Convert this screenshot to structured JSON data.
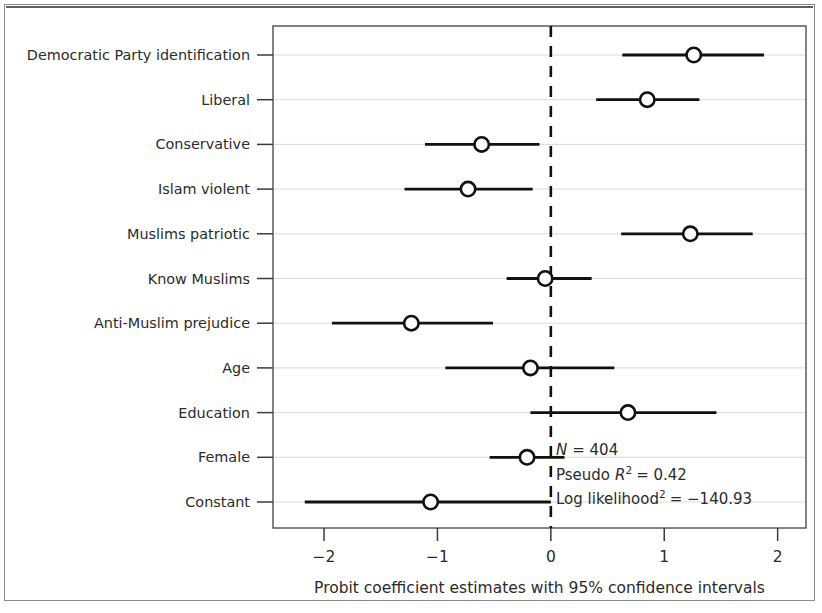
{
  "figure": {
    "background_color": "#ffffff",
    "line_color": "#111111",
    "grid_color": "#d9d9d9",
    "frame_color": "#4f4f4f"
  },
  "annotations": {
    "n_label": "N",
    "n_value": "= 404",
    "pseudo_label": "Pseudo",
    "pseudo_r": "R",
    "pseudo_sup": "2",
    "pseudo_value": "= 0.42",
    "loglik_label": "Log likelihood",
    "loglik_sup": "2",
    "loglik_value": "= −140.93"
  },
  "chart_data": {
    "type": "scatter",
    "title": "",
    "xlabel": "Probit coefficient estimates with 95% confidence intervals",
    "ylabel": "",
    "xlim": [
      -2.45,
      2.25
    ],
    "xticks": [
      -2,
      -1,
      0,
      1,
      2
    ],
    "xticklabels": [
      "−2",
      "−1",
      "0",
      "1",
      "2"
    ],
    "grid": true,
    "legend": "none",
    "reference_line": 0,
    "reference_line_style": "dashed",
    "categories": [
      "Democratic Party identification",
      "Liberal",
      "Conservative",
      "Islam violent",
      "Muslims patriotic",
      "Know Muslims",
      "Anti-Muslim prejudice",
      "Age",
      "Education",
      "Female",
      "Constant"
    ],
    "estimates": [
      1.26,
      0.85,
      -0.61,
      -0.73,
      1.23,
      -0.05,
      -1.23,
      -0.18,
      0.68,
      -0.21,
      -1.06
    ],
    "ci_low": [
      0.63,
      0.4,
      -1.11,
      -1.29,
      0.62,
      -0.39,
      -1.93,
      -0.93,
      -0.18,
      -0.54,
      -2.17
    ],
    "ci_high": [
      1.88,
      1.31,
      -0.1,
      -0.16,
      1.78,
      0.36,
      -0.51,
      0.56,
      1.46,
      0.12,
      0.0
    ]
  }
}
